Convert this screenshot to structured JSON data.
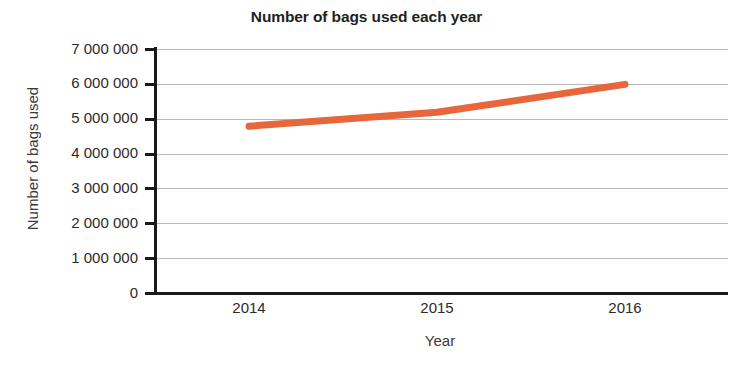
{
  "chart_data": {
    "type": "line",
    "title": "Number of bags used each year",
    "xlabel": "Year",
    "ylabel": "Number of bags used",
    "categories": [
      "2014",
      "2015",
      "2016"
    ],
    "x": [
      2014,
      2015,
      2016
    ],
    "series": [
      {
        "name": "Number of bags used",
        "color": "#e8663c",
        "values": [
          4800000,
          5200000,
          6000000
        ]
      }
    ],
    "ylim": [
      0,
      7000000
    ],
    "ytick_values": [
      0,
      1000000,
      2000000,
      3000000,
      4000000,
      5000000,
      6000000,
      7000000
    ],
    "ytick_labels": [
      "0",
      "1 000 000",
      "2 000 000",
      "3 000 000",
      "4 000 000",
      "5 000 000",
      "6 000 000",
      "7 000 000"
    ],
    "grid": true,
    "grid_axis": "y",
    "legend": false,
    "legend_position": "none",
    "axis_color": "#1a1a1a",
    "grid_color": "#b9b9b9",
    "background": "#ffffff"
  }
}
